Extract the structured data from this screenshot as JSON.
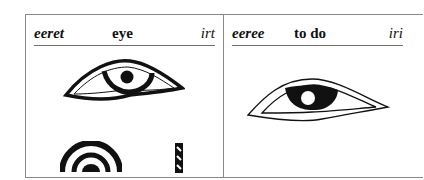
{
  "entries": [
    {
      "transliteration": "eeret",
      "meaning": "eye",
      "egyptian": "irt",
      "glyphs": [
        "eye-hieroglyph",
        "mouth-semicircle-determinative",
        "stroke-determinative"
      ]
    },
    {
      "transliteration": "eeree",
      "meaning": "to do",
      "egyptian": "iri",
      "glyphs": [
        "eye-hieroglyph"
      ]
    }
  ],
  "colors": {
    "ink": "#111111",
    "border": "#8a8a8a",
    "background": "#ffffff"
  }
}
